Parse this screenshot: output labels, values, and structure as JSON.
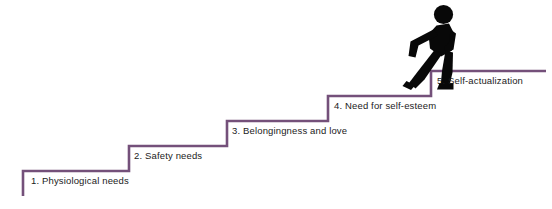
{
  "figure": {
    "background_color": "#ffffff",
    "step_line_color": "#74507a",
    "walker_color": "#080808",
    "label_color": "#1b1b1b"
  },
  "walker": {
    "icon": "walking-person-icon",
    "description": "Black pictogram of a person climbing the top step"
  },
  "steps": [
    {
      "number": "1",
      "label": "1. Physiological needs",
      "tread_y": 171,
      "tread_x_start": 23,
      "tread_x_end": 129,
      "riser_bottom_y": 196,
      "label_x": 31,
      "label_y": 180
    },
    {
      "number": "2",
      "label": "2. Safety needs",
      "tread_y": 146,
      "tread_x_start": 129,
      "tread_x_end": 227,
      "riser_bottom_y": 171,
      "label_x": 134,
      "label_y": 155
    },
    {
      "number": "3",
      "label": "3. Belongingness and love",
      "tread_y": 121,
      "tread_x_start": 227,
      "tread_x_end": 328,
      "riser_bottom_y": 146,
      "label_x": 232,
      "label_y": 130
    },
    {
      "number": "4",
      "label": "4. Need for self-esteem",
      "tread_y": 96,
      "tread_x_start": 328,
      "tread_x_end": 431,
      "riser_bottom_y": 121,
      "label_x": 334,
      "label_y": 105
    },
    {
      "number": "5",
      "label": "5. Self-actualization",
      "tread_y": 71,
      "tread_x_start": 431,
      "tread_x_end": 546,
      "riser_bottom_y": 96,
      "label_x": 437,
      "label_y": 80
    }
  ]
}
